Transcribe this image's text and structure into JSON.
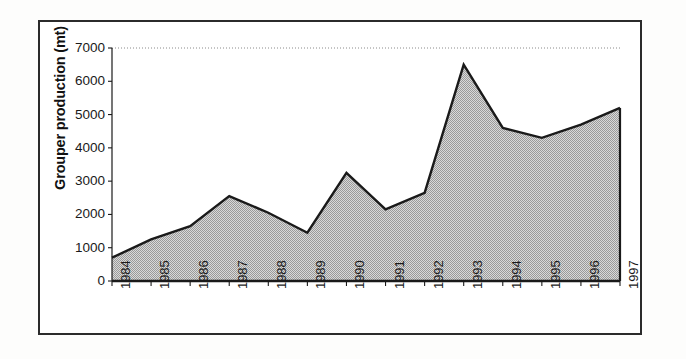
{
  "figure": {
    "border_color": "#2b2b2b",
    "background": "#ffffff"
  },
  "chart_data": {
    "type": "area",
    "title": "",
    "subtitle": "",
    "xlabel": "",
    "ylabel": "Grouper production (mt)",
    "categories": [
      "1984",
      "1985",
      "1986",
      "1987",
      "1988",
      "1989",
      "1990",
      "1991",
      "1992",
      "1993",
      "1994",
      "1995",
      "1996",
      "1997"
    ],
    "values": [
      700,
      1250,
      1650,
      2550,
      2050,
      1450,
      3250,
      2150,
      2650,
      6500,
      4600,
      4300,
      4700,
      5200
    ],
    "series": [
      {
        "name": "Grouper production",
        "values": [
          700,
          1250,
          1650,
          2550,
          2050,
          1450,
          3250,
          2150,
          2650,
          6500,
          4600,
          4300,
          4700,
          5200
        ]
      }
    ],
    "ylim": [
      0,
      7000
    ],
    "y_ticks": [
      0,
      1000,
      2000,
      3000,
      4000,
      5000,
      6000,
      7000
    ],
    "y_tick_labels": [
      "0",
      "1000",
      "2000",
      "3000",
      "4000",
      "5000",
      "6000",
      "7000"
    ],
    "grid": "top-dotted-only",
    "legend": "none",
    "fill_color": "#b4b4b4",
    "line_color": "#1a1a1a",
    "axis_color": "#1a1a1a"
  }
}
